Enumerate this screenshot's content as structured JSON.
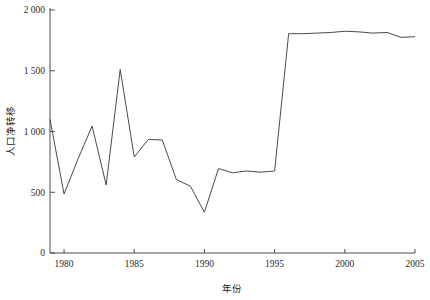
{
  "chart_data": {
    "type": "line",
    "title": "",
    "xlabel": "年份",
    "ylabel": "人口净转移",
    "xlim": [
      1979,
      2005
    ],
    "ylim": [
      0,
      2000
    ],
    "grid": false,
    "legend": null,
    "x_ticks": [
      "1980",
      "1985",
      "1990",
      "1995",
      "2000",
      "2005"
    ],
    "x_tick_values": [
      1980,
      1985,
      1990,
      1995,
      2000,
      2005
    ],
    "y_ticks": [
      "0",
      "500",
      "1 000",
      "1 500",
      "2 000"
    ],
    "y_tick_values": [
      0,
      500,
      1000,
      1500,
      2000
    ],
    "x": [
      1979,
      1980,
      1981,
      1982,
      1983,
      1984,
      1985,
      1986,
      1987,
      1988,
      1989,
      1990,
      1991,
      1992,
      1993,
      1994,
      1995,
      1996,
      1997,
      1998,
      1999,
      2000,
      2001,
      2002,
      2003,
      2004,
      2005
    ],
    "series": [
      {
        "name": "人口净转移",
        "color": "#4a4a4a",
        "values": [
          1100,
          485,
          775,
          1045,
          560,
          1510,
          790,
          935,
          930,
          605,
          550,
          335,
          695,
          660,
          675,
          665,
          675,
          1805,
          1805,
          1810,
          1815,
          1825,
          1820,
          1810,
          1815,
          1775,
          1780
        ]
      }
    ]
  },
  "axes": {
    "y_label_text": "人口净转移",
    "x_label_text": "年份"
  }
}
